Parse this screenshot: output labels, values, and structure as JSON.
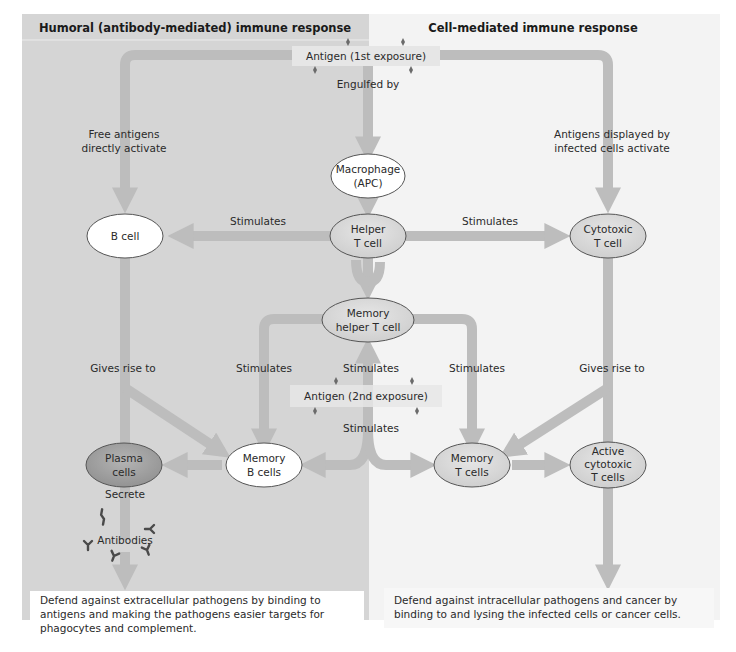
{
  "panels": {
    "humoral": {
      "title": "Humoral (antibody-mediated) immune response",
      "background": "#d5d5d5",
      "outcome": "Defend against extracellular pathogens by binding to antigens and making the pathogens easier targets for phagocytes and complement."
    },
    "cell_mediated": {
      "title": "Cell-mediated immune response",
      "background": "#f3f3f3",
      "outcome": "Defend against intracellular pathogens and cancer by binding to and lysing the infected cells or cancer cells."
    }
  },
  "antigen_boxes": {
    "first": "Antigen (1st exposure)",
    "second": "Antigen (2nd exposure)"
  },
  "nodes": {
    "macrophage": {
      "line1": "Macrophage",
      "line2": "(APC)",
      "fill": "white"
    },
    "b_cell": {
      "line1": "B cell",
      "fill": "white"
    },
    "helper_t": {
      "line1": "Helper",
      "line2": "T cell",
      "fill": "gray"
    },
    "cytotoxic_t": {
      "line1": "Cytotoxic",
      "line2": "T cell",
      "fill": "gray"
    },
    "memory_helper_t": {
      "line1": "Memory",
      "line2": "helper T cell",
      "fill": "gray"
    },
    "plasma": {
      "line1": "Plasma",
      "line2": "cells",
      "fill": "dark-gray"
    },
    "memory_b": {
      "line1": "Memory",
      "line2": "B cells",
      "fill": "white"
    },
    "memory_t": {
      "line1": "Memory",
      "line2": "T cells",
      "fill": "gray"
    },
    "active_cytotoxic": {
      "line1": "Active",
      "line2": "cytotoxic",
      "line3": "T cells",
      "fill": "gray"
    }
  },
  "edge_labels": {
    "engulfed_by": "Engulfed by",
    "free_antigens_line1": "Free antigens",
    "free_antigens_line2": "directly activate",
    "displayed_line1": "Antigens displayed by",
    "displayed_line2": "infected cells activate",
    "stimulates_macrophage_helper": "Stimulates",
    "stimulates_helper_b": "Stimulates",
    "stimulates_helper_cytotoxic": "Stimulates",
    "gives_rise_b": "Gives rise to",
    "gives_rise_cytotoxic": "Gives rise to",
    "stimulates_mem_helper_left": "Stimulates",
    "stimulates_mem_helper_center": "Stimulates",
    "stimulates_mem_helper_right": "Stimulates",
    "stimulates_second_exposure": "Stimulates",
    "secrete": "Secrete"
  },
  "antibodies_label": "Antibodies",
  "colors": {
    "arrow": "#bdbdbd",
    "node_white": "#ffffff",
    "node_gray": "#d9d9d9",
    "node_dark": "#a3a3a3",
    "node_stroke": "#555555",
    "antigen_box": "#e6e6e6",
    "antigen_glyph": "#6b6b6b",
    "antibody_glyph": "#4a4a4a"
  }
}
